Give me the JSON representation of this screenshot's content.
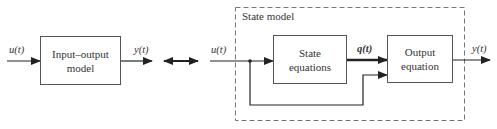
{
  "diagram": {
    "left": {
      "input_label": "u(t)",
      "block_label_line1": "Input–output",
      "block_label_line2": "model",
      "output_label": "y(t)"
    },
    "equivalence_symbol": "double-arrow",
    "right": {
      "group_title": "State model",
      "input_label": "u(t)",
      "state_block_line1": "State",
      "state_block_line2": "equations",
      "state_vector_label": "q(t)",
      "output_block_line1": "Output",
      "output_block_line2": "equation",
      "output_label": "y(t)"
    },
    "colors": {
      "line": "#222222",
      "box_border": "#555555",
      "dashed": "#777777"
    }
  }
}
